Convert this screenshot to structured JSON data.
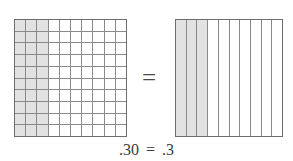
{
  "figure": {
    "name": "decimal-equivalence-model",
    "background_color": "#ffffff",
    "line_color": "#8a8a8a",
    "border_color": "#6e6e6e",
    "shade_color": "#e2e2e2",
    "text_color": "#3a3a3a"
  },
  "left_model": {
    "label": "hundredths-grid",
    "rows": 10,
    "columns": 10,
    "total_cells": 100,
    "shaded_columns": 3,
    "shaded_cells": 30,
    "value": ".30"
  },
  "right_model": {
    "label": "tenths-grid",
    "columns": 10,
    "total_cells": 10,
    "shaded_columns": 3,
    "shaded_cells": 3,
    "value": ".3"
  },
  "equals_symbol": "=",
  "caption": {
    "left_value": ".30",
    "equals": "=",
    "right_value": ".3",
    "full_text": ".30 = .3"
  },
  "chart_data": {
    "type": "table",
    "title": ".30 = .3",
    "xlabel": "",
    "ylabel": "",
    "categories": [
      "hundredths grid (10x10)",
      "tenths grid (10 strips)"
    ],
    "series": [
      {
        "name": "shaded parts",
        "values": [
          30,
          3
        ]
      },
      {
        "name": "total parts",
        "values": [
          100,
          10
        ]
      }
    ],
    "values": [
      0.3,
      0.3
    ],
    "annotations": [
      ".30",
      "=",
      ".3"
    ],
    "grid": true,
    "legend": "none"
  }
}
